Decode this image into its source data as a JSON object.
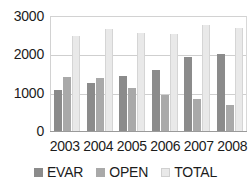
{
  "chart_data": {
    "type": "bar",
    "title": "",
    "subtitle": "",
    "xlabel": "",
    "ylabel": "",
    "categories": [
      "2003",
      "2004",
      "2005",
      "2006",
      "2007",
      "2008"
    ],
    "series": [
      {
        "name": "EVAR",
        "color": "#8b8b8b",
        "values": [
          1070,
          1260,
          1440,
          1590,
          1940,
          2020
        ]
      },
      {
        "name": "OPEN",
        "color": "#a9a9a9",
        "values": [
          1410,
          1380,
          1110,
          940,
          840,
          690
        ]
      },
      {
        "name": "TOTAL",
        "color": "#e9e9e9",
        "values": [
          2480,
          2660,
          2560,
          2540,
          2770,
          2700
        ]
      }
    ],
    "ylim": [
      0,
      3000
    ],
    "yticks": [
      0,
      1000,
      2000,
      3000
    ],
    "ytick_labels": [
      "0",
      "1000",
      "2000",
      "3000"
    ],
    "grid": true,
    "legend_position": "bottom",
    "annotations": []
  },
  "axes": {
    "y_ticks": [
      {
        "label": "3000",
        "value": 3000
      },
      {
        "label": "2000",
        "value": 2000
      },
      {
        "label": "1000",
        "value": 1000
      },
      {
        "label": "0",
        "value": 0
      }
    ],
    "x_ticks": [
      {
        "label": "2003"
      },
      {
        "label": "2004"
      },
      {
        "label": "2005"
      },
      {
        "label": "2006"
      },
      {
        "label": "2007"
      },
      {
        "label": "2008"
      }
    ]
  },
  "legend": {
    "items": [
      {
        "label": "EVAR",
        "color": "#8b8b8b"
      },
      {
        "label": "OPEN",
        "color": "#a9a9a9"
      },
      {
        "label": "TOTAL",
        "color": "#e9e9e9"
      }
    ]
  }
}
